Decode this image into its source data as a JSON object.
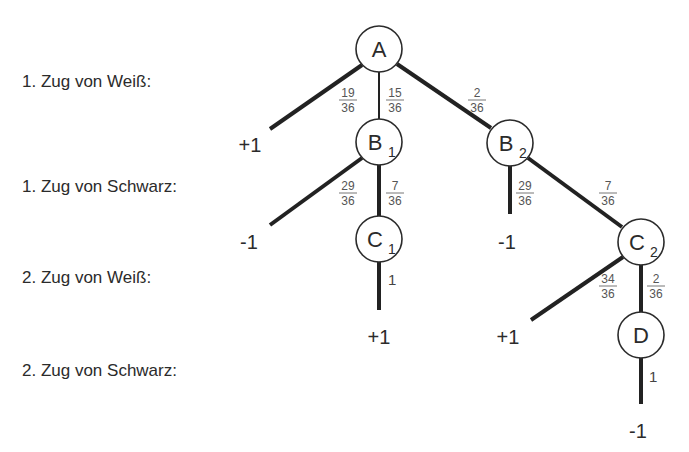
{
  "row_labels": [
    "1. Zug von Weiß:",
    "1. Zug von Schwarz:",
    "2. Zug von Weiß:",
    "2. Zug von Schwarz:"
  ],
  "nodes": [
    {
      "id": "A",
      "label": "A",
      "sub": ""
    },
    {
      "id": "B1",
      "label": "B",
      "sub": "1"
    },
    {
      "id": "B2",
      "label": "B",
      "sub": "2"
    },
    {
      "id": "C1",
      "label": "C",
      "sub": "1"
    },
    {
      "id": "C2",
      "label": "C",
      "sub": "2"
    },
    {
      "id": "D",
      "label": "D",
      "sub": ""
    }
  ],
  "edges": [
    {
      "from": "A",
      "to": "leaf-A-left",
      "prob": {
        "num": "19",
        "den": "36"
      }
    },
    {
      "from": "A",
      "to": "B1",
      "prob": {
        "num": "15",
        "den": "36"
      }
    },
    {
      "from": "A",
      "to": "B2",
      "prob": {
        "num": "2",
        "den": "36"
      }
    },
    {
      "from": "B1",
      "to": "leaf-B1-left",
      "prob": {
        "num": "29",
        "den": "36"
      }
    },
    {
      "from": "B1",
      "to": "C1",
      "prob": {
        "num": "7",
        "den": "36"
      }
    },
    {
      "from": "B2",
      "to": "leaf-B2-down",
      "prob": {
        "num": "29",
        "den": "36"
      }
    },
    {
      "from": "B2",
      "to": "C2",
      "prob": {
        "num": "7",
        "den": "36"
      }
    },
    {
      "from": "C1",
      "to": "leaf-C1-down",
      "prob": {
        "whole": "1"
      }
    },
    {
      "from": "C2",
      "to": "leaf-C2-left",
      "prob": {
        "num": "34",
        "den": "36"
      }
    },
    {
      "from": "C2",
      "to": "D",
      "prob": {
        "num": "2",
        "den": "36"
      }
    },
    {
      "from": "D",
      "to": "leaf-D-down",
      "prob": {
        "whole": "1"
      }
    }
  ],
  "leaves": [
    {
      "id": "leaf-A-left",
      "value": "+1"
    },
    {
      "id": "leaf-B1-left",
      "value": "-1"
    },
    {
      "id": "leaf-B2-down",
      "value": "-1"
    },
    {
      "id": "leaf-C1-down",
      "value": "+1"
    },
    {
      "id": "leaf-C2-left",
      "value": "+1"
    },
    {
      "id": "leaf-D-down",
      "value": "-1"
    }
  ]
}
